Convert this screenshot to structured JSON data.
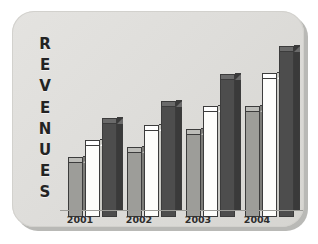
{
  "card": {
    "background_color": "#dedddA",
    "shadow_color": "#b9b9b6"
  },
  "axis_title": {
    "text": "REVENUES",
    "orientation": "vertical-stacked",
    "letters": [
      "R",
      "E",
      "V",
      "E",
      "N",
      "U",
      "E",
      "S"
    ],
    "color": "#232323"
  },
  "chart_data": {
    "type": "bar",
    "xlabel": "",
    "ylabel": "REVENUES",
    "categories": [
      "2001",
      "2002",
      "2003",
      "2004"
    ],
    "series": [
      {
        "name": "series-1",
        "color": "#9d9d99",
        "values": [
          39,
          46,
          59,
          75
        ]
      },
      {
        "name": "series-2",
        "color": "#fdfdfb",
        "values": [
          51,
          62,
          75,
          99
        ]
      },
      {
        "name": "series-3",
        "color": "#4d4d4d",
        "values": [
          67,
          79,
          98,
          118
        ]
      }
    ],
    "ylim": [
      0,
      130
    ],
    "grid": false,
    "legend": "none",
    "style": "3d-columns"
  },
  "x_axis": {
    "tick_labels": [
      "2001",
      "2002",
      "2003",
      "2004"
    ],
    "line_color": "#9b9b97"
  }
}
